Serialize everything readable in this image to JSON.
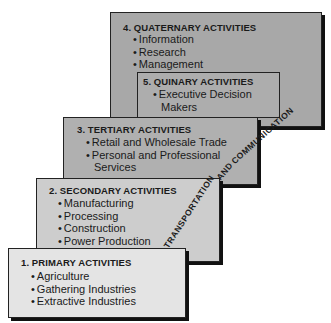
{
  "boxes": {
    "quaternary": {
      "title": "4. QUATERNARY ACTIVITIES",
      "items": [
        "Information",
        "Research",
        "Management"
      ]
    },
    "quinary": {
      "title": "5. QUINARY ACTIVITIES",
      "items": [
        "Executive Decision",
        "Makers"
      ]
    },
    "tertiary": {
      "title": "3. TERTIARY ACTIVITIES",
      "items": [
        "Retail and Wholesale Trade",
        "Personal and Professional",
        "Services"
      ]
    },
    "secondary": {
      "title": "2. SECONDARY ACTIVITIES",
      "items": [
        "Manufacturing",
        "Processing",
        "Construction",
        "Power Production"
      ]
    },
    "primary": {
      "title": "1. PRIMARY ACTIVITIES",
      "items": [
        "Agriculture",
        "Gathering Industries",
        "Extractive Industries"
      ]
    }
  },
  "diagonal_label": {
    "part1": "TRANSPORTATION",
    "part2": "AND",
    "part3": "COMMUNICATION"
  },
  "colors": {
    "quaternary_fill": "#a8a8a8",
    "tertiary_fill": "#b0b0b0",
    "secondary_fill": "#cdcdcd",
    "primary_fill": "#e4e4e4",
    "border": "#222222"
  }
}
